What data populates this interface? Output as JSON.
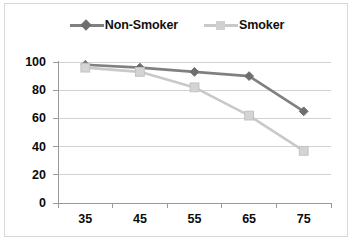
{
  "chart_data": {
    "type": "line",
    "title": "",
    "xlabel": "",
    "ylabel": "",
    "categories": [
      "35",
      "45",
      "55",
      "65",
      "75"
    ],
    "series": [
      {
        "name": "Non-Smoker",
        "values": [
          98,
          96,
          93,
          90,
          65
        ],
        "color": "#808080",
        "marker": "diamond"
      },
      {
        "name": "Smoker",
        "values": [
          96,
          93,
          82,
          62,
          37
        ],
        "color": "#c9c9c9",
        "marker": "square"
      }
    ],
    "ylim": [
      0,
      100
    ],
    "yticks": [
      "0",
      "20",
      "40",
      "60",
      "80",
      "100"
    ],
    "grid": "horizontal",
    "legend_position": "top-center"
  },
  "legend": {
    "entries": [
      {
        "label": "Non-Smoker"
      },
      {
        "label": "Smoker"
      }
    ]
  },
  "axes": {
    "y_tick_labels": [
      "100",
      "80",
      "60",
      "40",
      "20",
      "0"
    ],
    "x_tick_labels": [
      "35",
      "45",
      "55",
      "65",
      "75"
    ]
  },
  "colors": {
    "non_smoker": "#808080",
    "smoker": "#c9c9c9",
    "gridline": "#d2d2d2",
    "axis": "#9a9a9a",
    "frame": "#d9d9d9",
    "text": "#0b0b0b",
    "background": "#ffffff"
  }
}
